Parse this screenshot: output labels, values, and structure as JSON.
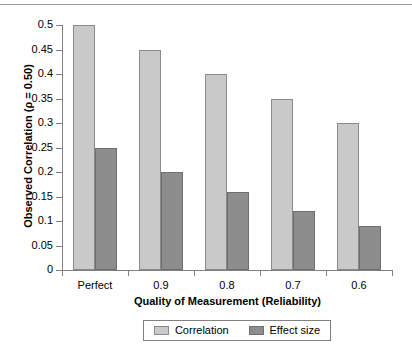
{
  "figure": {
    "top_rule": true,
    "background_color": "#ffffff"
  },
  "chart_data": {
    "type": "bar",
    "title": "",
    "categories": [
      "Perfect",
      "0.9",
      "0.8",
      "0.7",
      "0.6"
    ],
    "series": [
      {
        "name": "Correlation",
        "color": "#c9c9c9",
        "values": [
          0.5,
          0.45,
          0.4,
          0.35,
          0.3
        ]
      },
      {
        "name": "Effect size",
        "color": "#8d8d8d",
        "values": [
          0.25,
          0.2,
          0.16,
          0.12,
          0.09
        ]
      }
    ],
    "xlabel": "Quality of Measurement (Reliability)",
    "ylabel": "Observed Correlation (ρ = 0.50)",
    "ylim": [
      0,
      0.5
    ],
    "ytick_values": [
      0,
      0.05,
      0.1,
      0.15,
      0.2,
      0.25,
      0.3,
      0.35,
      0.4,
      0.45,
      0.5
    ],
    "ytick_labels": [
      "0",
      "0.05",
      "0.1",
      "0.15",
      "0.2",
      "0.25",
      "0.3",
      "0.35",
      "0.4",
      "0.45",
      "0.5"
    ],
    "grid": false,
    "legend_position": "bottom",
    "legend_entries": [
      "Correlation",
      "Effect size"
    ]
  }
}
